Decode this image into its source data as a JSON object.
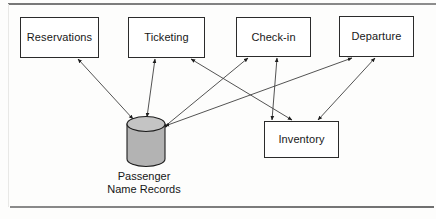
{
  "figure": {
    "background_color": "#fdfdfc",
    "line_color": "#2b2b2b",
    "datastore_fill": "#b3b3b3"
  },
  "nodes": [
    {
      "id": "reservations",
      "label": "Reservations",
      "shape": "rectangle",
      "x": 20,
      "y": 17,
      "w": 79,
      "h": 41
    },
    {
      "id": "ticketing",
      "label": "Ticketing",
      "shape": "rectangle",
      "x": 128,
      "y": 17,
      "w": 77,
      "h": 41
    },
    {
      "id": "checkin",
      "label": "Check-in",
      "shape": "rectangle",
      "x": 236,
      "y": 17,
      "w": 75,
      "h": 40
    },
    {
      "id": "departure",
      "label": "Departure",
      "shape": "rectangle",
      "x": 339,
      "y": 16,
      "w": 75,
      "h": 41
    },
    {
      "id": "inventory",
      "label": "Inventory",
      "shape": "rectangle",
      "x": 264,
      "y": 121,
      "w": 75,
      "h": 37
    }
  ],
  "datastore": {
    "id": "pnr",
    "label_line1": "Passenger",
    "label_line2": "Name Records",
    "shape": "cylinder",
    "x": 126,
    "y": 117,
    "w": 38,
    "h": 48
  },
  "edges": [
    {
      "id": "reservations-pnr",
      "from": "reservations",
      "to": "pnr",
      "arrows": "both"
    },
    {
      "id": "ticketing-pnr",
      "from": "ticketing",
      "to": "pnr",
      "arrows": "both"
    },
    {
      "id": "checkin-pnr",
      "from": "checkin",
      "to": "pnr",
      "arrows": "both"
    },
    {
      "id": "departure-pnr",
      "from": "departure",
      "to": "pnr",
      "arrows": "both"
    },
    {
      "id": "ticketing-inventory",
      "from": "ticketing",
      "to": "inventory",
      "arrows": "both"
    },
    {
      "id": "checkin-inventory",
      "from": "checkin",
      "to": "inventory",
      "arrows": "both"
    },
    {
      "id": "departure-inventory",
      "from": "departure",
      "to": "inventory",
      "arrows": "both"
    }
  ]
}
